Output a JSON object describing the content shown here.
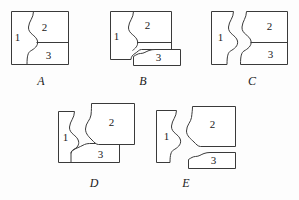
{
  "figure_set": {
    "title": "Puzzle piece arrangement figures",
    "background_color": "#fdfdfd",
    "line_color": "#3a3a3a",
    "piece_fill": "#ffffff",
    "figures": [
      {
        "label": "A",
        "description": "All three pieces joined forming a complete rectangle",
        "pieces": [
          {
            "number": "1",
            "name": "piece-one"
          },
          {
            "number": "2",
            "name": "piece-two"
          },
          {
            "number": "3",
            "name": "piece-three"
          }
        ]
      },
      {
        "label": "B",
        "description": "Pieces 1 and 2 joined; piece 3 detached and shifted down-right",
        "pieces": [
          {
            "number": "1",
            "name": "piece-one"
          },
          {
            "number": "2",
            "name": "piece-two"
          },
          {
            "number": "3",
            "name": "piece-three"
          }
        ]
      },
      {
        "label": "C",
        "description": "Piece 1 detached on the left; pieces 2 and 3 joined on the right",
        "pieces": [
          {
            "number": "1",
            "name": "piece-one"
          },
          {
            "number": "2",
            "name": "piece-two"
          },
          {
            "number": "3",
            "name": "piece-three"
          }
        ]
      },
      {
        "label": "D",
        "description": "Pieces 1 and 3 joined; piece 2 detached and shifted up-right",
        "pieces": [
          {
            "number": "1",
            "name": "piece-one"
          },
          {
            "number": "2",
            "name": "piece-two"
          },
          {
            "number": "3",
            "name": "piece-three"
          }
        ]
      },
      {
        "label": "E",
        "description": "All three pieces detached and separated from each other",
        "pieces": [
          {
            "number": "1",
            "name": "piece-one"
          },
          {
            "number": "2",
            "name": "piece-two"
          },
          {
            "number": "3",
            "name": "piece-three"
          }
        ]
      }
    ]
  }
}
